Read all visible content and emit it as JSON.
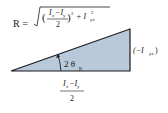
{
  "diagram": {
    "type": "mohr-circle-principal-angle-triangle",
    "colors": {
      "fill": "#b9c9dc",
      "stroke": "#1a1a1a"
    },
    "hypotenuse_label": {
      "prefix": "R =",
      "numerator": "I",
      "numerator_sub1": "z",
      "minus": "−I",
      "numerator_sub2": "y",
      "denominator": "2",
      "power": "2",
      "plus": "+ I",
      "term_sub": "yz",
      "term_power": "2"
    },
    "vertical_leg_label": {
      "open": "(−I",
      "sub": "yz",
      "close": ")"
    },
    "horizontal_leg_label": {
      "numerator": "I",
      "sub1": "z",
      "minus": "−I",
      "sub2": "y",
      "denominator": "2"
    },
    "angle_label": {
      "value": "2 θ",
      "sub": "p"
    }
  }
}
